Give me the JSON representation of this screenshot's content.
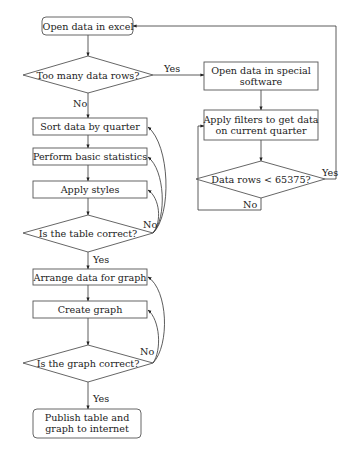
{
  "nodes": {
    "open_excel": {
      "lines": [
        "Open data in excel"
      ]
    },
    "too_many_rows": {
      "lines": [
        "Too many data rows?"
      ]
    },
    "open_special": {
      "lines": [
        "Open data in special",
        "software"
      ]
    },
    "apply_filters": {
      "lines": [
        "Apply filters to get data",
        "on current quarter"
      ]
    },
    "data_rows_check": {
      "lines": [
        "Data rows < 65375?"
      ]
    },
    "sort_data": {
      "lines": [
        "Sort data by quarter"
      ]
    },
    "basic_stats": {
      "lines": [
        "Perform basic statistics"
      ]
    },
    "apply_styles": {
      "lines": [
        "Apply styles"
      ]
    },
    "table_correct": {
      "lines": [
        "Is the table correct?"
      ]
    },
    "arrange_data": {
      "lines": [
        "Arrange data for graph"
      ]
    },
    "create_graph": {
      "lines": [
        "Create graph"
      ]
    },
    "graph_correct": {
      "lines": [
        "Is the graph correct?"
      ]
    },
    "publish": {
      "lines": [
        "Publish table and",
        "graph to internet"
      ]
    }
  },
  "edge_labels": {
    "too_many_yes": "Yes",
    "too_many_no": "No",
    "rows_check_yes": "Yes",
    "rows_check_no": "No",
    "table_no": "No",
    "table_yes": "Yes",
    "graph_no": "No",
    "graph_yes": "Yes"
  }
}
